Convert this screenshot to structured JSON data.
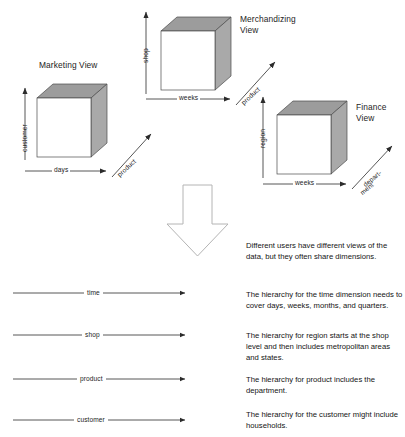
{
  "diagram": {
    "title_absent": true,
    "cubes": [
      {
        "id": "marketing",
        "title": "Marketing View",
        "vertical_axis": "customer",
        "horizontal_axis": "days",
        "depth_axis": "product"
      },
      {
        "id": "merchandizing",
        "title_line1": "Merchandizing",
        "title_line2": "View",
        "vertical_axis": "shop",
        "horizontal_axis": "weeks",
        "depth_axis": "product"
      },
      {
        "id": "finance",
        "title_line1": "Finance",
        "title_line2": "View",
        "vertical_axis": "region",
        "horizontal_axis": "weeks",
        "depth_axis_line1": "depart-",
        "depth_axis_line2": "ment"
      }
    ],
    "dimension_arrows": [
      {
        "label": "time"
      },
      {
        "label": "shop"
      },
      {
        "label": "product"
      },
      {
        "label": "customer"
      }
    ],
    "notes": [
      "Different users have different views of the data, but they often share dimensions.",
      "The hierarchy for the time dimension needs to cover days, weeks, months, and quarters.",
      "The hierarchy for region starts at the shop level and then includes metropolitan areas and states.",
      "The hierarchy for product includes the department.",
      "The hierarchy for the customer might include households."
    ],
    "colors": {
      "cube_front": "#ffffff",
      "cube_top": "#9c9c9c",
      "cube_side": "#a9a9a9",
      "stroke": "#4a4a4a",
      "arrow": "#2b2b2b",
      "big_arrow_stroke": "#b4b4b4",
      "text": "#1a1a1a"
    },
    "icons": {
      "down_arrow": "big-down-arrow-icon"
    }
  }
}
